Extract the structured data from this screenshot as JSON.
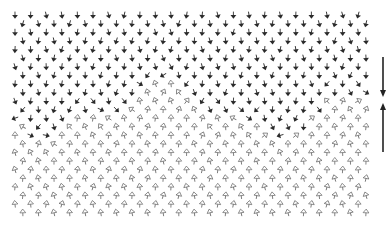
{
  "figure": {
    "lattice": {
      "rows": 24,
      "cols": 23,
      "x0": 15,
      "y0": 15,
      "dx": 15.6,
      "dy": 8.6,
      "row_offset": 7.8
    },
    "domains": [
      {
        "name": "upper",
        "fill": "#2a2a2a",
        "style": "filled",
        "direction": "down"
      },
      {
        "name": "lower",
        "fill": "#ffffff",
        "stroke": "#555555",
        "style": "hollow",
        "direction": "up"
      }
    ],
    "wall": {
      "mean_row": 11,
      "amplitude_rows": 2.5,
      "wavelength_cols": 14,
      "width_rows": 1.6
    },
    "legend": {
      "down_arrow": {
        "x": 383,
        "y1": 57,
        "y2": 97,
        "color": "#222222",
        "label": "down"
      },
      "up_arrow": {
        "x": 383,
        "y1": 152,
        "y2": 103,
        "color": "#222222",
        "label": "up"
      }
    }
  }
}
